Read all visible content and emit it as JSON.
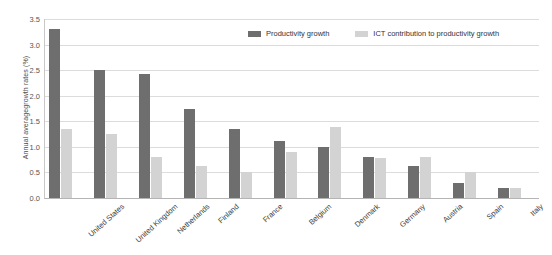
{
  "chart_data": {
    "type": "bar",
    "title": "",
    "xlabel": "",
    "ylabel": "Annual averagegrowth rates (%)",
    "ylim": [
      0,
      3.5
    ],
    "ytick_step": 0.5,
    "grid": true,
    "legend_position": "top-right",
    "categories": [
      "United States",
      "United Kingdom",
      "Netherlands",
      "Finland",
      "France",
      "Belgium",
      "Denmark",
      "Germany",
      "Austria",
      "Spain",
      "Italy"
    ],
    "ytick_labels": [
      "0.0",
      "0.5",
      "1.0",
      "1.5",
      "2.0",
      "2.5",
      "3.0",
      "3.5"
    ],
    "ytick_values": [
      0.0,
      0.5,
      1.0,
      1.5,
      2.0,
      2.5,
      3.0,
      3.5
    ],
    "series": [
      {
        "name": "Productivity growth",
        "color": "#6e6e6e",
        "values": [
          3.3,
          2.5,
          2.42,
          1.75,
          1.35,
          1.12,
          1.0,
          0.8,
          0.62,
          0.3,
          0.2
        ]
      },
      {
        "name": "ICT contribution to productivity growth",
        "color": "#d3d3d3",
        "values": [
          1.35,
          1.25,
          0.8,
          0.62,
          0.5,
          0.9,
          1.38,
          0.78,
          0.8,
          0.5,
          0.2
        ]
      }
    ]
  },
  "colors": {
    "primary": "#6e6e6e",
    "secondary": "#d3d3d3",
    "gridline": "#dcdcdc",
    "axis": "#b4b4b4",
    "background": "#ffffff"
  }
}
